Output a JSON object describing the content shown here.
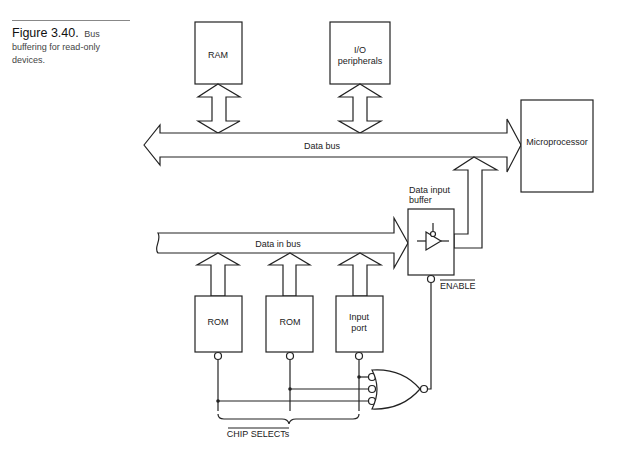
{
  "caption": {
    "figure_number": "Figure 3.40.",
    "text": "Bus buffering for read-only devices."
  },
  "diagram": {
    "blocks": {
      "ram": "RAM",
      "io_line1": "I/O",
      "io_line2": "peripherals",
      "microprocessor": "Microprocessor",
      "rom1": "ROM",
      "rom2": "ROM",
      "input_port_line1": "Input",
      "input_port_line2": "port"
    },
    "buses": {
      "data_bus": "Data bus",
      "data_in_bus": "Data in bus"
    },
    "buffer": {
      "label_line1": "Data input",
      "label_line2": "buffer",
      "enable": "ENABLE"
    },
    "chip_selects": "CHIP SELECTs"
  }
}
